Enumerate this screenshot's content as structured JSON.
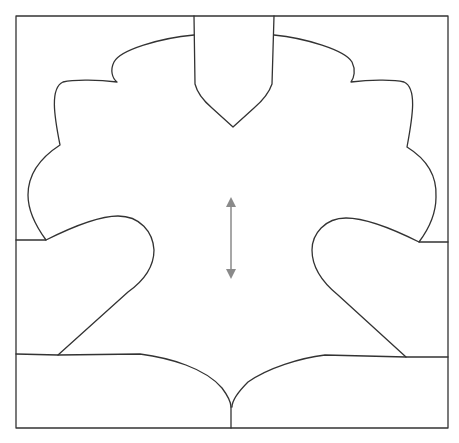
{
  "diagram": {
    "type": "sewing-pattern-piece",
    "header_text": "",
    "colors": {
      "outline": "#333333",
      "grainline_arrow": "#8a8a8a",
      "background": "#ffffff"
    },
    "frame": {
      "x": 16,
      "y": 16,
      "width": 432,
      "height": 412
    },
    "elements": [
      {
        "name": "center-top-pocket",
        "description": "Pointed shield-shaped tab at top center"
      },
      {
        "name": "left-scalloped-edge",
        "description": "Scalloped upper-left contour"
      },
      {
        "name": "right-scalloped-edge",
        "description": "Scalloped upper-right contour"
      },
      {
        "name": "left-wing-lobe",
        "description": "Rounded lobe on left"
      },
      {
        "name": "right-wing-lobe",
        "description": "Rounded lobe on right"
      },
      {
        "name": "bottom-curved-seam",
        "description": "Curved seam meeting at center cusp"
      },
      {
        "name": "grainline-arrow",
        "description": "Vertical double-headed grainline arrow"
      }
    ]
  }
}
